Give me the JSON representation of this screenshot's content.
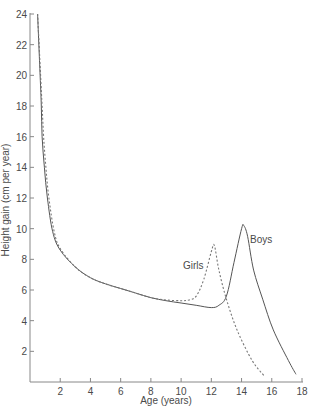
{
  "chart_data": {
    "type": "line",
    "title": "",
    "xlabel": "Age (years)",
    "ylabel": "Height gain (cm per year)",
    "xlim": [
      0,
      18
    ],
    "ylim": [
      0,
      24
    ],
    "grid": false,
    "legend": "inline labels",
    "x_ticks": [
      2,
      4,
      6,
      8,
      10,
      12,
      14,
      16,
      18
    ],
    "y_ticks": [
      2,
      4,
      6,
      8,
      10,
      12,
      14,
      16,
      18,
      20,
      22,
      24
    ],
    "series": [
      {
        "name": "Boys",
        "style": "solid",
        "color": "#555555",
        "label_pos": {
          "x": 14.5,
          "y": 10.0
        },
        "points": [
          [
            0.5,
            24.0
          ],
          [
            0.67,
            20.0
          ],
          [
            0.75,
            18.0
          ],
          [
            0.8,
            16.0
          ],
          [
            0.95,
            14.0
          ],
          [
            1.15,
            12.0
          ],
          [
            1.5,
            9.8
          ],
          [
            2.0,
            8.6
          ],
          [
            3.0,
            7.5
          ],
          [
            4.0,
            6.8
          ],
          [
            5.0,
            6.4
          ],
          [
            6.0,
            6.1
          ],
          [
            7.0,
            5.8
          ],
          [
            8.0,
            5.5
          ],
          [
            9.0,
            5.3
          ],
          [
            10.0,
            5.15
          ],
          [
            11.0,
            5.0
          ],
          [
            12.0,
            4.85
          ],
          [
            12.5,
            5.0
          ],
          [
            13.0,
            5.6
          ],
          [
            13.5,
            7.8
          ],
          [
            14.0,
            10.0
          ],
          [
            14.15,
            10.2
          ],
          [
            14.4,
            9.5
          ],
          [
            14.8,
            7.3
          ],
          [
            15.4,
            5.4
          ],
          [
            16.1,
            3.4
          ],
          [
            17.1,
            1.4
          ],
          [
            17.6,
            0.5
          ]
        ]
      },
      {
        "name": "Girls",
        "style": "dashed",
        "color": "#777777",
        "label_pos": {
          "x": 10.2,
          "y": 7.3
        },
        "points": [
          [
            0.5,
            24.0
          ],
          [
            0.7,
            20.0
          ],
          [
            0.8,
            18.0
          ],
          [
            0.9,
            16.0
          ],
          [
            1.05,
            14.0
          ],
          [
            1.25,
            12.0
          ],
          [
            1.6,
            9.8
          ],
          [
            2.0,
            8.7
          ],
          [
            3.0,
            7.5
          ],
          [
            4.0,
            6.8
          ],
          [
            5.0,
            6.4
          ],
          [
            6.0,
            6.1
          ],
          [
            7.0,
            5.8
          ],
          [
            8.0,
            5.5
          ],
          [
            9.0,
            5.35
          ],
          [
            10.0,
            5.3
          ],
          [
            10.5,
            5.35
          ],
          [
            11.0,
            5.6
          ],
          [
            11.5,
            6.7
          ],
          [
            12.0,
            8.5
          ],
          [
            12.2,
            8.9
          ],
          [
            12.5,
            7.3
          ],
          [
            13.0,
            5.4
          ],
          [
            13.7,
            3.4
          ],
          [
            14.7,
            1.4
          ],
          [
            15.5,
            0.4
          ]
        ]
      }
    ]
  },
  "labels": {
    "xlabel": "Age (years)",
    "ylabel": "Height gain (cm per year)",
    "boys": "Boys",
    "girls": "Girls"
  }
}
